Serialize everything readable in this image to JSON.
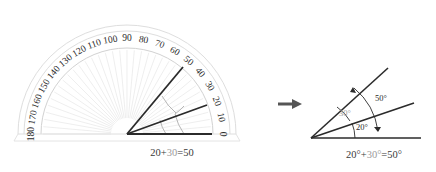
{
  "figure": {
    "background_color": "#ffffff"
  },
  "colors": {
    "ray": "#2b2b2b",
    "scale_text": "#2b2b2b",
    "protractor_rim": "#d8d8d8",
    "protractor_ticks": "#e6e6e6",
    "arc_guide": "#b8b8b8",
    "equation_text": "#3a3a3a",
    "equation_highlight": "#9a9a9a",
    "arrow": "#555555",
    "baseline": "#2b2b2b"
  },
  "left_panel": {
    "name": "protractor-figure",
    "protractor": {
      "scale_labels": [
        "0",
        "10",
        "20",
        "30",
        "40",
        "50",
        "60",
        "70",
        "80",
        "90",
        "100",
        "110",
        "120",
        "130",
        "140",
        "150",
        "160",
        "170",
        "180"
      ],
      "scale_step": 10,
      "scale_min": 0,
      "scale_max": 180,
      "tick_count": 36
    },
    "rays": [
      {
        "name": "baseline-ray",
        "degrees": 0,
        "label": "0"
      },
      {
        "name": "middle-ray",
        "degrees": 20,
        "label": "20"
      },
      {
        "name": "upper-ray",
        "degrees": 50,
        "label": "50"
      }
    ],
    "arcs": [
      {
        "name": "inner-arc-20",
        "from_degrees": 0,
        "to_degrees": 20
      },
      {
        "name": "outer-arc-50",
        "from_degrees": 20,
        "to_degrees": 50
      }
    ],
    "equation": {
      "a": "20",
      "plus": "+",
      "b": "30",
      "equals": "=",
      "result": "50",
      "full": "20+30=50"
    }
  },
  "arrow": {
    "name": "transition-arrow",
    "direction": "right",
    "glyph": "→"
  },
  "right_panel": {
    "name": "angle-figure",
    "rays": [
      {
        "name": "baseline-ray",
        "degrees": 0
      },
      {
        "name": "middle-ray",
        "degrees": 20
      },
      {
        "name": "upper-ray",
        "degrees": 50
      }
    ],
    "angle_labels": [
      {
        "name": "angle-label-20",
        "text": "20°",
        "value": 20,
        "highlight": false
      },
      {
        "name": "angle-label-30",
        "text": "30°",
        "value": 30,
        "highlight": true
      },
      {
        "name": "angle-label-50",
        "text": "50°",
        "value": 50,
        "highlight": false
      }
    ],
    "equation": {
      "a": "20°",
      "plus": "+",
      "b": "30°",
      "equals": "=",
      "result": "50°",
      "full": "20°+30°=50°"
    }
  }
}
